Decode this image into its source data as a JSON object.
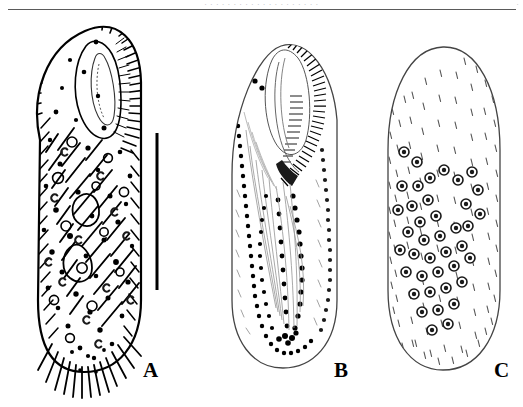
{
  "page": {
    "width": 523,
    "height": 407,
    "background_color": "#ffffff",
    "ink_color": "#000000",
    "running_head": "· · · · · · · · · · · · · · · · · · · ·",
    "folio": "·",
    "header_rule_color": "#5a5a5a"
  },
  "figure": {
    "kind": "scientific-line-drawing",
    "panel_count": 3,
    "panels": [
      {
        "id": "A",
        "label": "A",
        "view": "ventral view of live specimen",
        "description": "Elongate ovoid cell densely covered with cirri, cortical granules and C-shaped inclusions, buccal field at anterior right, caudal cirri at posterior",
        "bounds": {
          "x": 25,
          "y": 22,
          "width": 120,
          "height": 355
        },
        "features": [
          "adoral zone of membranelles",
          "buccal cavity",
          "frontal cirri",
          "ventral cirri",
          "marginal cirri",
          "caudal cirri",
          "cortical granules",
          "C-shaped macronuclear nodules"
        ]
      },
      {
        "id": "B",
        "label": "B",
        "view": "ventral infraciliature",
        "description": "Outline of cell showing adoral zone of membranelles as dense parallel strokes and rows of basal bodies drawn as discrete dots",
        "bounds": {
          "x": 218,
          "y": 40,
          "width": 125,
          "height": 330
        },
        "features": [
          "adoral zone of membranelles",
          "paroral membrane",
          "frontoventral cirral rows",
          "left marginal row",
          "right marginal row",
          "transverse cirri"
        ]
      },
      {
        "id": "C",
        "label": "C",
        "view": "dorsal infraciliature",
        "description": "Outline of cell with dorsal bristles shown as short dashes in longitudinal kineties and scattered macronuclear nodules",
        "bounds": {
          "x": 378,
          "y": 44,
          "width": 128,
          "height": 330
        },
        "features": [
          "dorsal kineties",
          "dorsal bristles",
          "macronuclear nodules",
          "micronuclei"
        ]
      }
    ],
    "scale_bar": {
      "orientation": "vertical",
      "x": 157,
      "y_top": 133,
      "y_bottom": 290,
      "thickness": 3,
      "color": "#000000",
      "caption": ""
    },
    "labels": [
      {
        "text": "A",
        "x": 143,
        "y": 360
      },
      {
        "text": "B",
        "x": 334,
        "y": 360
      },
      {
        "text": "C",
        "x": 494,
        "y": 360
      }
    ]
  }
}
